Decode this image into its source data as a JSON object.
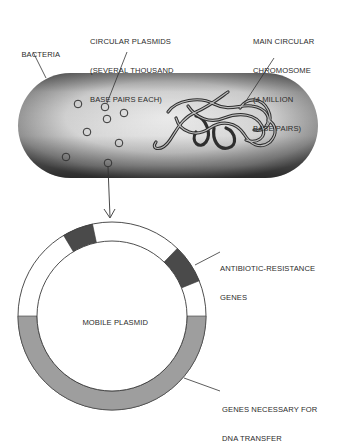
{
  "labels": {
    "bacteria": "BACTERIA",
    "circular_plasmids": [
      "CIRCULAR PLASMIDS",
      "(SEVERAL THOUSAND",
      "BASE PAIRS EACH)"
    ],
    "main_chromosome": [
      "MAIN CIRCULAR",
      "CHROMOSOME",
      "(4 MILLION",
      "BASE PAIRS)"
    ],
    "mobile_plasmid": "MOBILE PLASMID",
    "antibiotic_resistance": [
      "ANTIBIOTIC-RESISTANCE",
      "GENES"
    ],
    "dna_transfer": [
      "GENES NECESSARY FOR",
      "DNA TRANSFER"
    ]
  },
  "diagram": {
    "bacterium": {
      "x": 18,
      "y": 73,
      "width": 300,
      "height": 105
    },
    "small_plasmids": [
      {
        "cx": 78,
        "cy": 104
      },
      {
        "cx": 105,
        "cy": 107
      },
      {
        "cx": 124,
        "cy": 113
      },
      {
        "cx": 107,
        "cy": 119
      },
      {
        "cx": 87,
        "cy": 132
      },
      {
        "cx": 119,
        "cy": 143
      },
      {
        "cx": 66,
        "cy": 157
      },
      {
        "cx": 108,
        "cy": 163
      }
    ],
    "mobile_plasmid_ring": {
      "cx": 112,
      "cy": 316,
      "outer_r": 94,
      "inner_r": 75,
      "segments": [
        {
          "name": "antibiotic-resistance-gene-1",
          "start_deg": -31,
          "end_deg": -12,
          "color": "#4a4a4a"
        },
        {
          "name": "antibiotic-resistance-gene-2",
          "start_deg": 44,
          "end_deg": 68,
          "color": "#4a4a4a"
        },
        {
          "name": "dna-transfer-genes",
          "start_deg": 90,
          "end_deg": 270,
          "color": "#9e9e9e"
        }
      ]
    },
    "colors": {
      "outline": "#3a3a3a",
      "bacterium_light": "#e8e8e8",
      "bacterium_dark": "#6a6a6a",
      "resistance_genes": "#4a4a4a",
      "transfer_genes": "#9e9e9e"
    }
  }
}
